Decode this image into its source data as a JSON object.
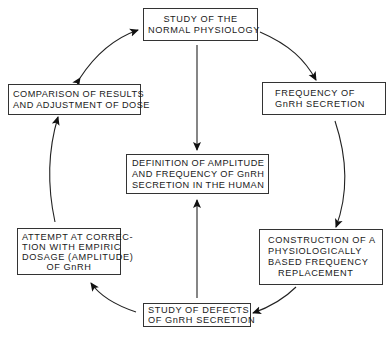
{
  "diagram": {
    "type": "cycle-flowchart",
    "nodes": [
      {
        "id": "normal_physiology",
        "lines": [
          "STUDY OF THE",
          "NORMAL PHYSIOLOGY"
        ]
      },
      {
        "id": "frequency_secretion",
        "lines": [
          "FREQUENCY OF",
          "GnRH SECRETION"
        ]
      },
      {
        "id": "construction",
        "lines": [
          "CONSTRUCTION OF A",
          "PHYSIOLOGICALLY",
          "BASED FREQUENCY",
          "REPLACEMENT"
        ]
      },
      {
        "id": "study_defects",
        "lines": [
          "STUDY OF DEFECTS",
          "OF GnRH SECRETION"
        ]
      },
      {
        "id": "attempt_correction",
        "lines": [
          "ATTEMPT AT CORREC-",
          "TION WITH EMPIRIC",
          "DOSAGE (AMPLITUDE)",
          "OF GnRH"
        ]
      },
      {
        "id": "comparison",
        "lines": [
          "COMPARISON OF RESULTS",
          "AND ADJUSTMENT OF DOSE"
        ]
      },
      {
        "id": "definition",
        "lines": [
          "DEFINITION OF AMPLITUDE",
          "AND FREQUENCY OF GnRH",
          "SECRETION IN THE HUMAN"
        ]
      }
    ],
    "edges": [
      {
        "from": "normal_physiology",
        "to": "frequency_secretion",
        "style": "curved"
      },
      {
        "from": "frequency_secretion",
        "to": "construction",
        "style": "curved"
      },
      {
        "from": "construction",
        "to": "study_defects",
        "style": "curved"
      },
      {
        "from": "study_defects",
        "to": "attempt_correction",
        "style": "curved"
      },
      {
        "from": "attempt_correction",
        "to": "comparison",
        "style": "curved"
      },
      {
        "from": "comparison",
        "to": "normal_physiology",
        "style": "curved-bidirectional"
      },
      {
        "from": "normal_physiology",
        "to": "definition",
        "style": "straight"
      },
      {
        "from": "study_defects",
        "to": "definition",
        "style": "straight"
      }
    ],
    "colors": {
      "line": "#1a1a1a",
      "background": "#ffffff"
    }
  }
}
